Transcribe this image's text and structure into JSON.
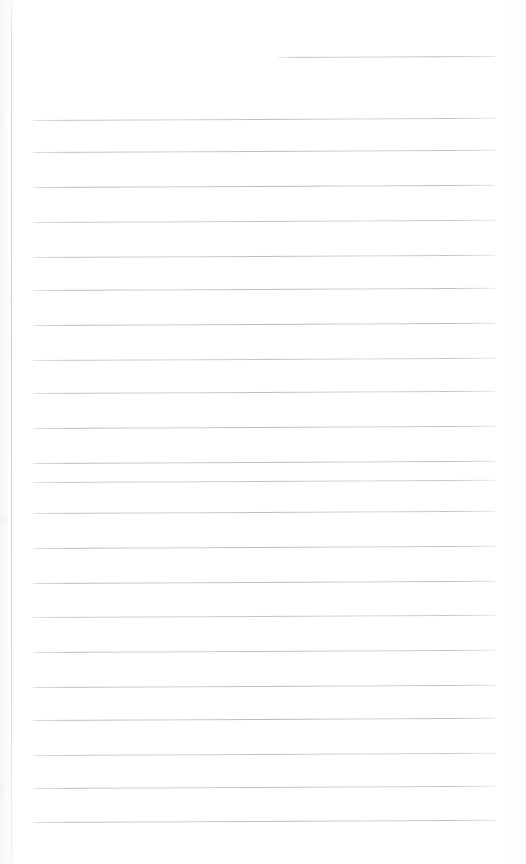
{
  "document": {
    "kind": "scanned-ruled-notepad-page",
    "title": "Blank Ruled Notepad Page",
    "content_text": "",
    "page_width": 526,
    "page_height": 864
  },
  "colors": {
    "paper": "#ffffff",
    "rule_line": "#b0b3bb",
    "margin_rule": "#ced0d6",
    "edge_shadow": "#f2f2f4"
  },
  "margin_rule": {
    "name": "left-margin-rule",
    "x": 11,
    "top": 0,
    "bottom": 864
  },
  "ruled_lines": {
    "left_x": 33,
    "right_x": 495,
    "spacing": 34.3,
    "skew_deg": -0.28,
    "lines": [
      {
        "index": 0,
        "y": 57,
        "x_start": 277,
        "x_end": 495,
        "partial": true
      },
      {
        "index": 1,
        "y": 120,
        "x_start": 33,
        "x_end": 495,
        "partial": false
      },
      {
        "index": 2,
        "y": 152,
        "x_start": 33,
        "x_end": 495,
        "partial": false
      },
      {
        "index": 3,
        "y": 187,
        "x_start": 33,
        "x_end": 495,
        "partial": false
      },
      {
        "index": 4,
        "y": 222,
        "x_start": 33,
        "x_end": 495,
        "partial": false
      },
      {
        "index": 5,
        "y": 257,
        "x_start": 33,
        "x_end": 495,
        "partial": false
      },
      {
        "index": 6,
        "y": 290,
        "x_start": 33,
        "x_end": 495,
        "partial": false
      },
      {
        "index": 7,
        "y": 325,
        "x_start": 33,
        "x_end": 495,
        "partial": false
      },
      {
        "index": 8,
        "y": 360,
        "x_start": 33,
        "x_end": 495,
        "partial": false
      },
      {
        "index": 9,
        "y": 393,
        "x_start": 33,
        "x_end": 495,
        "partial": false
      },
      {
        "index": 10,
        "y": 428,
        "x_start": 33,
        "x_end": 495,
        "partial": false
      },
      {
        "index": 11,
        "y": 463,
        "x_start": 33,
        "x_end": 495,
        "partial": false
      },
      {
        "index": 12,
        "y": 482,
        "x_start": 33,
        "x_end": 495,
        "partial": false
      },
      {
        "index": 13,
        "y": 513,
        "x_start": 33,
        "x_end": 495,
        "partial": false
      },
      {
        "index": 14,
        "y": 548,
        "x_start": 33,
        "x_end": 495,
        "partial": false
      },
      {
        "index": 15,
        "y": 583,
        "x_start": 33,
        "x_end": 495,
        "partial": false
      },
      {
        "index": 16,
        "y": 617,
        "x_start": 33,
        "x_end": 495,
        "partial": false
      },
      {
        "index": 17,
        "y": 652,
        "x_start": 33,
        "x_end": 495,
        "partial": false
      },
      {
        "index": 18,
        "y": 687,
        "x_start": 33,
        "x_end": 495,
        "partial": false
      },
      {
        "index": 19,
        "y": 720,
        "x_start": 33,
        "x_end": 495,
        "partial": false
      },
      {
        "index": 20,
        "y": 755,
        "x_start": 33,
        "x_end": 495,
        "partial": false
      },
      {
        "index": 21,
        "y": 788,
        "x_start": 33,
        "x_end": 495,
        "partial": false
      },
      {
        "index": 22,
        "y": 822,
        "x_start": 33,
        "x_end": 495,
        "partial": false
      }
    ]
  }
}
